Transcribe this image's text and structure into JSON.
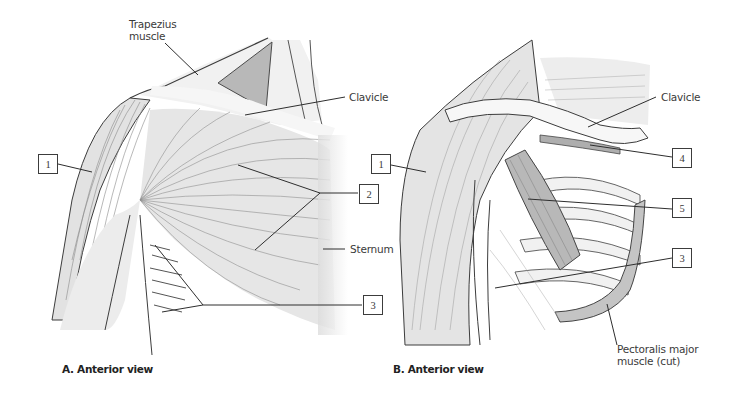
{
  "figure": {
    "panels": [
      {
        "id": "A",
        "caption": "A. Anterior view",
        "text_labels": {
          "trapezius_line1": "Trapezius",
          "trapezius_line2": "muscle",
          "clavicle": "Clavicle",
          "sternum": "Sternum"
        },
        "numbered_boxes": [
          "1",
          "2",
          "3"
        ]
      },
      {
        "id": "B",
        "caption": "B. Anterior view",
        "text_labels": {
          "clavicle": "Clavicle",
          "pectoralis_line1": "Pectoralis major",
          "pectoralis_line2": "muscle (cut)"
        },
        "numbered_boxes": [
          "1",
          "4",
          "5",
          "3"
        ]
      }
    ]
  },
  "colors": {
    "background": "#ffffff",
    "outline": "#3c3c3c",
    "muscle_fiber": "#9a9a9a",
    "muscle_shade": "#c8c8c8",
    "highlight_muscle": "#b5b5b5",
    "text": "#3a3a3a"
  }
}
